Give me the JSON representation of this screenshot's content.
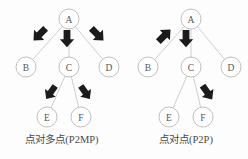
{
  "figure": {
    "panels": [
      {
        "id": "p2mp",
        "caption": "点对多点(P2MP)",
        "nodes": [
          {
            "id": "A",
            "label": "A",
            "cx": 69,
            "cy": 19,
            "r": 10
          },
          {
            "id": "B",
            "label": "B",
            "cx": 26,
            "cy": 67,
            "r": 10
          },
          {
            "id": "C",
            "label": "C",
            "cx": 69,
            "cy": 67,
            "r": 10
          },
          {
            "id": "D",
            "label": "D",
            "cx": 109,
            "cy": 67,
            "r": 10
          },
          {
            "id": "E",
            "label": "E",
            "cx": 47,
            "cy": 117,
            "r": 10
          },
          {
            "id": "F",
            "label": "F",
            "cx": 81,
            "cy": 117,
            "r": 10
          }
        ],
        "edges": [
          {
            "from": "A",
            "to": "B"
          },
          {
            "from": "A",
            "to": "C"
          },
          {
            "from": "A",
            "to": "D"
          },
          {
            "from": "C",
            "to": "E"
          },
          {
            "from": "C",
            "to": "F"
          }
        ],
        "arrows": [
          {
            "name": "arrow-a-to-b",
            "x": 40,
            "y": 34,
            "angle": 135,
            "scale": 1.0
          },
          {
            "name": "arrow-a-to-c",
            "x": 67,
            "y": 38,
            "angle": 90,
            "scale": 1.0
          },
          {
            "name": "arrow-a-to-d",
            "x": 97,
            "y": 34,
            "angle": 45,
            "scale": 1.0
          },
          {
            "name": "arrow-c-to-e",
            "x": 51,
            "y": 92,
            "angle": 125,
            "scale": 0.92
          },
          {
            "name": "arrow-c-to-f",
            "x": 85,
            "y": 92,
            "angle": 55,
            "scale": 0.92
          }
        ]
      },
      {
        "id": "p2p",
        "caption": "点对点(P2P)",
        "nodes": [
          {
            "id": "A",
            "label": "A",
            "cx": 67,
            "cy": 19,
            "r": 10
          },
          {
            "id": "B",
            "label": "B",
            "cx": 24,
            "cy": 67,
            "r": 10
          },
          {
            "id": "C",
            "label": "C",
            "cx": 67,
            "cy": 67,
            "r": 10
          },
          {
            "id": "D",
            "label": "D",
            "cx": 107,
            "cy": 67,
            "r": 10
          },
          {
            "id": "E",
            "label": "E",
            "cx": 45,
            "cy": 117,
            "r": 10
          },
          {
            "id": "F",
            "label": "F",
            "cx": 79,
            "cy": 117,
            "r": 10
          }
        ],
        "edges": [
          {
            "from": "A",
            "to": "B"
          },
          {
            "from": "A",
            "to": "C"
          },
          {
            "from": "A",
            "to": "D"
          },
          {
            "from": "C",
            "to": "E"
          },
          {
            "from": "C",
            "to": "F"
          }
        ],
        "arrows": [
          {
            "name": "arrow-b-to-a",
            "x": 40,
            "y": 36,
            "angle": -45,
            "scale": 1.0
          },
          {
            "name": "arrow-a-to-c",
            "x": 62,
            "y": 38,
            "angle": 90,
            "scale": 1.0
          },
          {
            "name": "arrow-c-to-f",
            "x": 83,
            "y": 92,
            "angle": 55,
            "scale": 0.98
          }
        ]
      }
    ]
  },
  "colors": {
    "background": "#fdfdfd",
    "node_stroke": "#b9b9b9",
    "node_fill": "#ffffff",
    "node_label": "#555555",
    "edge": "#c2c2c2",
    "arrow": "#1b1b1b",
    "caption": "#4a4a4a"
  }
}
